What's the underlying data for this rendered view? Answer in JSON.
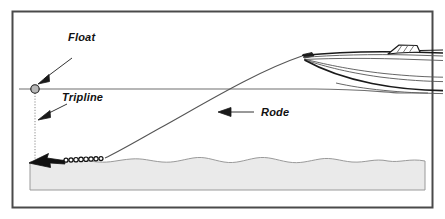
{
  "figure": {
    "background_color": "#ffffff",
    "border_color": "#4a4a4a",
    "seabed_color": "#eaeaea",
    "seabed_outline_color": "#9a9a9a",
    "waterline_color": "#6e6e6e",
    "rode_color": "#555555",
    "line_color": "#1a1a1a",
    "float_fill": "#b8b8b8"
  },
  "labels": {
    "float": "Float",
    "tripline": "Tripline",
    "rode": "Rode"
  },
  "elements": {
    "float_label": "Float",
    "tripline_label": "Tripline",
    "rode_label": "Rode",
    "boat_name": "motorboat",
    "anchor_name": "anchor",
    "chain_name": "chain",
    "waterline_name": "waterline",
    "seabed_name": "seabed"
  },
  "geometry": {
    "frame": {
      "x": 12,
      "y": 11,
      "w": 421,
      "h": 197
    },
    "waterline_y": 89,
    "seabed_top_y": 158,
    "seabed_bottom_y": 190,
    "float": {
      "cx": 35,
      "cy": 89,
      "r": 4
    },
    "anchor_tip": {
      "x": 29,
      "y": 163
    },
    "bow_point": {
      "x": 302,
      "y": 56
    },
    "chain_links": 9
  }
}
